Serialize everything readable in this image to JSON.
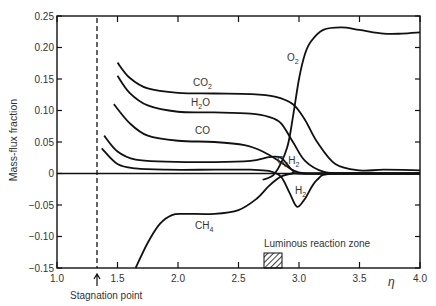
{
  "chart_data": {
    "type": "line",
    "title": "",
    "xlabel": "η",
    "ylabel": "Mass-flux fraction",
    "xlim": [
      1.0,
      4.0
    ],
    "ylim": [
      -0.15,
      0.25
    ],
    "grid": false,
    "legend": "inline labels",
    "x_ticks": [
      "1.0",
      "1.5",
      "2.0",
      "2.5",
      "3.0",
      "3.5",
      "4.0"
    ],
    "y_ticks": [
      "0.25",
      "0.20",
      "0.15",
      "0.10",
      "0.05",
      "0",
      "−0.05",
      "−0.10",
      "−0.15"
    ],
    "annotations": [
      {
        "text": "Stagnation point",
        "x": 1.33,
        "style": "dashed vertical line with arrow"
      },
      {
        "text": "Luminous reaction zone",
        "x_range": [
          2.72,
          2.85
        ],
        "style": "hatched box"
      }
    ],
    "series": [
      {
        "name": "O2",
        "label": "O₂",
        "x": [
          2.7,
          2.8,
          2.9,
          2.95,
          3.0,
          3.05,
          3.1,
          3.2,
          3.35,
          3.5,
          3.7,
          3.85,
          4.0
        ],
        "values": [
          -0.01,
          0.0,
          0.04,
          0.09,
          0.15,
          0.19,
          0.21,
          0.228,
          0.232,
          0.228,
          0.222,
          0.222,
          0.224
        ]
      },
      {
        "name": "CO2",
        "label": "CO₂",
        "x": [
          1.5,
          1.6,
          1.75,
          2.0,
          2.3,
          2.6,
          2.8,
          2.95,
          3.05,
          3.15,
          3.3,
          3.5,
          3.7,
          4.0
        ],
        "values": [
          0.176,
          0.152,
          0.135,
          0.128,
          0.127,
          0.126,
          0.122,
          0.11,
          0.085,
          0.05,
          0.015,
          0.005,
          0.006,
          0.005
        ]
      },
      {
        "name": "H2O",
        "label": "H₂O",
        "x": [
          1.5,
          1.6,
          1.75,
          2.0,
          2.3,
          2.6,
          2.75,
          2.85,
          2.95,
          3.05,
          3.2,
          3.4,
          4.0
        ],
        "values": [
          0.155,
          0.128,
          0.108,
          0.098,
          0.097,
          0.095,
          0.09,
          0.08,
          0.05,
          0.02,
          0.003,
          0.0,
          0.0
        ]
      },
      {
        "name": "CO",
        "label": "CO",
        "x": [
          1.47,
          1.6,
          1.75,
          2.0,
          2.3,
          2.55,
          2.7,
          2.85,
          2.95,
          3.05,
          3.2,
          4.0
        ],
        "values": [
          0.11,
          0.08,
          0.06,
          0.052,
          0.05,
          0.045,
          0.035,
          0.018,
          0.005,
          0.0,
          0.0,
          0.0
        ]
      },
      {
        "name": "C2H2",
        "label": "C₂H₂",
        "x": [
          1.39,
          1.5,
          1.65,
          1.9,
          2.3,
          2.6,
          2.75,
          2.85,
          2.95,
          3.05,
          4.0
        ],
        "values": [
          0.06,
          0.035,
          0.022,
          0.019,
          0.018,
          0.02,
          0.026,
          0.025,
          0.005,
          0.0,
          0.0
        ]
      },
      {
        "name": "H2",
        "label": "H₂",
        "x": [
          1.37,
          1.5,
          1.65,
          1.9,
          2.3,
          2.6,
          2.75,
          2.85,
          2.92,
          2.97,
          3.0,
          3.05,
          3.15,
          3.3,
          4.0
        ],
        "values": [
          0.04,
          0.015,
          0.008,
          0.006,
          0.006,
          0.006,
          0.004,
          -0.005,
          -0.03,
          -0.05,
          -0.052,
          -0.04,
          -0.01,
          0.0,
          0.0
        ]
      },
      {
        "name": "CH4",
        "label": "CH₄",
        "x": [
          1.65,
          1.75,
          1.85,
          1.95,
          2.05,
          2.3,
          2.5,
          2.65,
          2.75,
          2.85,
          2.95,
          3.1,
          4.0
        ],
        "values": [
          -0.15,
          -0.11,
          -0.08,
          -0.066,
          -0.064,
          -0.064,
          -0.058,
          -0.04,
          -0.02,
          -0.005,
          0.0,
          0.0,
          0.0
        ]
      },
      {
        "name": "baseline",
        "label": "",
        "x": [
          1.0,
          4.0
        ],
        "values": [
          0.0,
          0.0
        ]
      }
    ]
  },
  "labels": {
    "ylabel": "Mass-flux fraction",
    "xlabel": "η",
    "stagnation": "Stagnation point",
    "luminous": "Luminous reaction zone",
    "O2": "O",
    "O2_sub": "2",
    "CO2": "CO",
    "CO2_sub": "2",
    "H2O_a": "H",
    "H2O_sub": "2",
    "H2O_b": "O",
    "CO": "CO",
    "C2H2_a": "C",
    "C2H2_sub1": "2",
    "C2H2_b": "H",
    "C2H2_sub2": "2",
    "H2": "H",
    "H2_sub": "2",
    "CH4": "CH",
    "CH4_sub": "4"
  }
}
